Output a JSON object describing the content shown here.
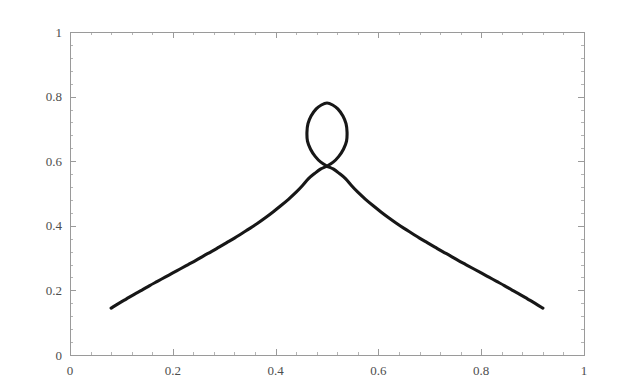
{
  "chart_data": {
    "type": "line",
    "title": "",
    "subtitle": "",
    "xlabel": "",
    "ylabel": "",
    "xlim": [
      0,
      1
    ],
    "ylim": [
      0,
      1
    ],
    "grid": false,
    "legend": null,
    "background_color": "#ffffff",
    "frame_color": "#9a9a9a",
    "curve_color": "#171717",
    "curve_width": 3.1,
    "x_ticks": [
      0,
      0.2,
      0.4,
      0.6,
      0.8,
      1
    ],
    "x_tick_labels": [
      "0",
      "0.2",
      "0.4",
      "0.6",
      "0.8",
      "1"
    ],
    "y_ticks": [
      0,
      0.2,
      0.4,
      0.6,
      0.8,
      1
    ],
    "y_tick_labels": [
      "0",
      "0.2",
      "0.4",
      "0.6",
      "0.8",
      "1"
    ],
    "x_minor_ticks_between": 4,
    "y_minor_ticks_between": 4,
    "series": [
      {
        "name": "curve",
        "closed": false,
        "description": "Symmetric cusp-like curve with a small teardrop loop at the apex; rises from lower-left endpoint to a self-intersection near (0.5, 0.585), loops up to (0.5, 0.78), then descends to the lower-right endpoint.",
        "annotations": {
          "left_endpoint": [
            0.08,
            0.145
          ],
          "right_endpoint": [
            0.92,
            0.145
          ],
          "self_intersection": [
            0.5,
            0.585
          ],
          "loop_apex": [
            0.5,
            0.78
          ],
          "loop_left_extent": [
            0.467,
            0.715
          ],
          "loop_right_extent": [
            0.539,
            0.715
          ]
        },
        "points": [
          [
            0.08,
            0.145
          ],
          [
            0.095,
            0.16
          ],
          [
            0.11,
            0.174
          ],
          [
            0.125,
            0.188
          ],
          [
            0.14,
            0.201
          ],
          [
            0.155,
            0.215
          ],
          [
            0.17,
            0.228
          ],
          [
            0.185,
            0.241
          ],
          [
            0.2,
            0.254
          ],
          [
            0.215,
            0.267
          ],
          [
            0.23,
            0.28
          ],
          [
            0.245,
            0.293
          ],
          [
            0.26,
            0.307
          ],
          [
            0.275,
            0.32
          ],
          [
            0.29,
            0.334
          ],
          [
            0.305,
            0.348
          ],
          [
            0.32,
            0.362
          ],
          [
            0.335,
            0.377
          ],
          [
            0.35,
            0.392
          ],
          [
            0.365,
            0.408
          ],
          [
            0.38,
            0.425
          ],
          [
            0.395,
            0.443
          ],
          [
            0.41,
            0.462
          ],
          [
            0.425,
            0.482
          ],
          [
            0.44,
            0.504
          ],
          [
            0.452,
            0.524
          ],
          [
            0.464,
            0.546
          ],
          [
            0.476,
            0.562
          ],
          [
            0.488,
            0.576
          ],
          [
            0.5,
            0.585
          ],
          [
            0.512,
            0.597
          ],
          [
            0.523,
            0.615
          ],
          [
            0.532,
            0.637
          ],
          [
            0.538,
            0.662
          ],
          [
            0.539,
            0.69
          ],
          [
            0.537,
            0.716
          ],
          [
            0.531,
            0.74
          ],
          [
            0.521,
            0.762
          ],
          [
            0.511,
            0.774
          ],
          [
            0.5,
            0.78
          ],
          [
            0.489,
            0.774
          ],
          [
            0.479,
            0.762
          ],
          [
            0.469,
            0.74
          ],
          [
            0.463,
            0.716
          ],
          [
            0.461,
            0.69
          ],
          [
            0.462,
            0.662
          ],
          [
            0.468,
            0.637
          ],
          [
            0.477,
            0.615
          ],
          [
            0.488,
            0.597
          ],
          [
            0.5,
            0.585
          ],
          [
            0.512,
            0.576
          ],
          [
            0.524,
            0.562
          ],
          [
            0.536,
            0.546
          ],
          [
            0.548,
            0.524
          ],
          [
            0.56,
            0.504
          ],
          [
            0.575,
            0.482
          ],
          [
            0.59,
            0.462
          ],
          [
            0.605,
            0.443
          ],
          [
            0.62,
            0.425
          ],
          [
            0.635,
            0.408
          ],
          [
            0.65,
            0.392
          ],
          [
            0.665,
            0.377
          ],
          [
            0.68,
            0.362
          ],
          [
            0.695,
            0.348
          ],
          [
            0.71,
            0.334
          ],
          [
            0.725,
            0.32
          ],
          [
            0.74,
            0.307
          ],
          [
            0.755,
            0.293
          ],
          [
            0.77,
            0.28
          ],
          [
            0.785,
            0.267
          ],
          [
            0.8,
            0.254
          ],
          [
            0.815,
            0.241
          ],
          [
            0.83,
            0.228
          ],
          [
            0.845,
            0.215
          ],
          [
            0.86,
            0.201
          ],
          [
            0.875,
            0.188
          ],
          [
            0.89,
            0.174
          ],
          [
            0.905,
            0.16
          ],
          [
            0.92,
            0.145
          ]
        ]
      }
    ]
  },
  "plot_geometry": {
    "width": 618,
    "height": 392,
    "frame_left": 70,
    "frame_right": 584,
    "frame_top": 32,
    "frame_bottom": 355,
    "major_tick_len": 6,
    "minor_tick_len": 3
  }
}
